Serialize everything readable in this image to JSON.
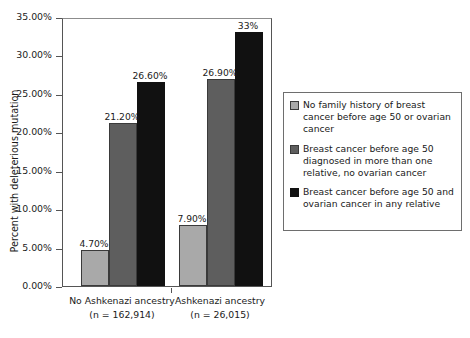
{
  "chart_data": {
    "type": "bar",
    "title": "",
    "subtitle": "",
    "xlabel": "",
    "ylabel": "Percent with deleterious mutation",
    "ylim": [
      0,
      35
    ],
    "ytick_labels": [
      "0.00%",
      "5.00%",
      "10.00%",
      "15.00%",
      "20.00%",
      "25.00%",
      "30.00%",
      "35.00%"
    ],
    "ytick_values": [
      0,
      5,
      10,
      15,
      20,
      25,
      30,
      35
    ],
    "grid": false,
    "legend_position": "right",
    "categories": [
      "No Ashkenazi ancestry",
      "Ashkenazi ancestry"
    ],
    "category_sublabels": [
      "(n = 162,914)",
      "(n = 26,015)"
    ],
    "series": [
      {
        "name": "No family history of breast cancer before age 50 or ovarian cancer",
        "color": "#a9a9a9",
        "values": [
          4.7,
          7.9
        ],
        "data_labels": [
          "4.70%",
          "7.90%"
        ]
      },
      {
        "name": "Breast cancer before age 50 diagnosed in more than one relative, no ovarian cancer",
        "color": "#5e5e5e",
        "values": [
          21.2,
          26.9
        ],
        "data_labels": [
          "21.20%",
          "26.90%"
        ]
      },
      {
        "name": "Breast cancer before age 50 and ovarian cancer in any relative",
        "color": "#111111",
        "values": [
          26.6,
          33.0
        ],
        "data_labels": [
          "26.60%",
          "33%"
        ]
      }
    ]
  },
  "legend": {
    "entries": [
      {
        "label": "No family history of breast cancer before age 50 or ovarian cancer"
      },
      {
        "label": "Breast cancer before age 50 diagnosed in more than one relative, no ovarian cancer"
      },
      {
        "label": "Breast cancer before age 50 and ovarian cancer in any relative"
      }
    ]
  }
}
